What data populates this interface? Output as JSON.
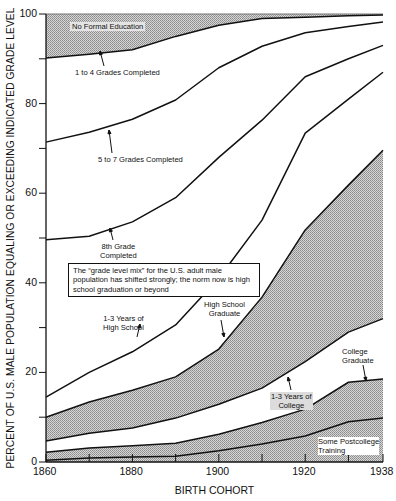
{
  "chart_data": {
    "type": "area",
    "title": "",
    "xlabel": "BIRTH COHORT",
    "ylabel": "PERCENT OF U.S. MALE POPULATION EQUALING OR EXCEEDING INDICATED GRADE LEVEL",
    "x": [
      1860,
      1870,
      1880,
      1890,
      1900,
      1910,
      1920,
      1930,
      1938
    ],
    "xlim": [
      1860,
      1938
    ],
    "ylim": [
      0,
      100
    ],
    "x_ticks": [
      1860,
      1870,
      1880,
      1890,
      1900,
      1910,
      1920,
      1930,
      1938
    ],
    "x_tick_labels": [
      "1860",
      "",
      "1880",
      "",
      "1900",
      "",
      "1920",
      "",
      "1938"
    ],
    "y_ticks": [
      0,
      10,
      20,
      30,
      40,
      50,
      60,
      70,
      80,
      90,
      100
    ],
    "y_tick_labels": [
      "0",
      "",
      "20",
      "",
      "40",
      "",
      "60",
      "",
      "80",
      "",
      "100"
    ],
    "grid": false,
    "series": [
      {
        "name": "1 to 4 Grades Completed",
        "values": [
          90.2,
          91.0,
          92.0,
          95.0,
          97.5,
          99.0,
          99.3,
          99.6,
          99.8
        ]
      },
      {
        "name": "5 to 7 Grades Completed",
        "values": [
          71.4,
          73.6,
          76.5,
          80.8,
          88.0,
          92.8,
          95.8,
          97.2,
          98.2
        ]
      },
      {
        "name": "8th Grade Completed",
        "values": [
          49.6,
          50.4,
          53.6,
          59.0,
          68.0,
          76.3,
          86.0,
          90.0,
          93.0
        ]
      },
      {
        "name": "1-3 Years of High School",
        "values": [
          14.5,
          20.0,
          24.6,
          30.6,
          41.0,
          54.0,
          73.4,
          81.0,
          87.0
        ]
      },
      {
        "name": "High School Graduate",
        "values": [
          10.0,
          13.4,
          16.0,
          19.0,
          25.2,
          36.8,
          51.8,
          61.8,
          69.6
        ]
      },
      {
        "name": "1-3 Years of College",
        "values": [
          4.7,
          6.4,
          7.6,
          9.8,
          12.9,
          16.5,
          22.4,
          29.0,
          32.0
        ]
      },
      {
        "name": "College Graduate",
        "values": [
          2.2,
          3.1,
          3.6,
          4.2,
          6.2,
          8.8,
          11.8,
          17.8,
          18.5
        ]
      },
      {
        "name": "Some Postcollege Training",
        "values": [
          0.4,
          0.9,
          1.1,
          1.3,
          2.5,
          4.0,
          5.8,
          9.0,
          9.8
        ]
      }
    ],
    "shaded_bands": [
      {
        "label": "No Formal Education",
        "lower": "1 to 4 Grades Completed",
        "upper": 100
      },
      {
        "label": "High School Graduate band",
        "lower": "1-3 Years of College",
        "upper": "High School Graduate"
      },
      {
        "label": "College Graduate band",
        "lower": 0,
        "upper": "College Graduate"
      }
    ],
    "annotations": [
      "No Formal Education",
      "1 to 4 Grades Completed",
      "5 to 7 Grades Completed",
      "8th Grade Completed",
      "1-3 Years of High School",
      "High School Graduate",
      "1-3 Years of College",
      "College Graduate",
      "Some Postcollege Training",
      "The \"grade level mix\" for the U.S. adult male population has shifted strongly; the norm now is high school graduation or beyond"
    ]
  },
  "labels": {
    "ylabel": "PERCENT OF U.S. MALE POPULATION EQUALING OR EXCEEDING INDICATED GRADE LEVEL",
    "xlabel": "BIRTH COHORT",
    "no_formal": "No Formal Education",
    "g1_4": "1 to 4 Grades Completed",
    "g5_7": "5 to 7 Grades Completed",
    "g8_line1": "8th Grade",
    "g8_line2": "Completed",
    "hs13_line1": "1-3 Years of",
    "hs13_line2": "High School",
    "hsgrad_line1": "High School",
    "hsgrad_line2": "Graduate",
    "col13_line1": "1-3 Years of",
    "col13_line2": "College",
    "colgrad_line1": "College",
    "colgrad_line2": "Graduate",
    "post_line1": "Some Postcollege",
    "post_line2": "Training",
    "callout": "The “grade level mix” for the U.S. adult male population has shifted strongly; the norm now is high school graduation or beyond"
  }
}
